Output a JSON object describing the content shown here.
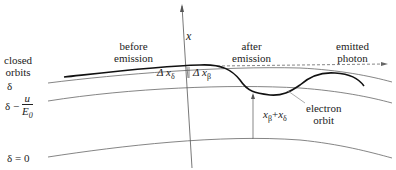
{
  "labels": {
    "closed_orbits": [
      "closed",
      "orbits"
    ],
    "delta": "δ",
    "delta_minus": "δ −",
    "frac_num": "u",
    "frac_den": "E",
    "frac_den_sub": "0",
    "delta_zero": "δ = 0",
    "before_emission": [
      "before",
      "emission"
    ],
    "after_emission": [
      "after",
      "emission"
    ],
    "emitted_photon": [
      "emitted",
      "photon"
    ],
    "axis_x": "x",
    "dx_delta": "Δ x",
    "dx_delta_sub": "δ",
    "dx_beta": "Δ x",
    "dx_beta_sub": "β",
    "x_sum_a": "x",
    "x_sum_a_sub": "β",
    "x_sum_plus": "+",
    "x_sum_b": "x",
    "x_sum_b_sub": "δ",
    "electron_orbit": [
      "electron",
      "orbit"
    ]
  }
}
